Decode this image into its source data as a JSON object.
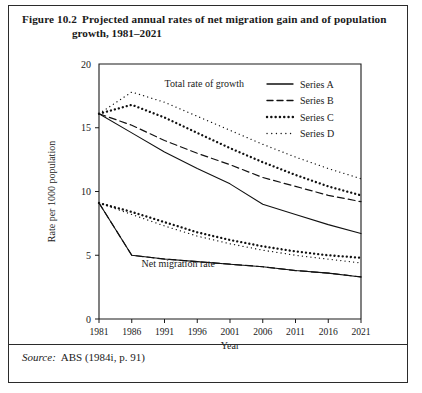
{
  "figure": {
    "number": "Figure 10.2",
    "caption_line1": "Projected annual rates of net migration gain and of population",
    "caption_line2": "growth, 1981–2021",
    "source_label": "Source:",
    "source_text": "ABS (1984i, p. 91)"
  },
  "chart_data": {
    "type": "line",
    "title": "Projected annual rates of net migration gain and of population growth, 1981–2021",
    "xlabel": "Year",
    "ylabel": "Rate per 1000 population",
    "x": [
      1981,
      1986,
      1991,
      1996,
      2001,
      2006,
      2011,
      2016,
      2021
    ],
    "xtick_labels": [
      "1981",
      "1986",
      "1991",
      "1996",
      "2001",
      "2006",
      "2011",
      "2016",
      "2021"
    ],
    "ytick_labels": [
      "0",
      "5",
      "10",
      "15",
      "20"
    ],
    "yticks": [
      0,
      5,
      10,
      15,
      20
    ],
    "xlim": [
      1981,
      2021
    ],
    "ylim": [
      0,
      20
    ],
    "grid": false,
    "legend_position": "top-right",
    "annotations": [
      {
        "text": "Total rate of growth",
        "x": 1991,
        "y": 18.2
      },
      {
        "text": "Net migration rate",
        "x": 1987.5,
        "y": 4.1
      }
    ],
    "groups": [
      {
        "name": "Total rate of growth",
        "series": [
          {
            "name": "Series A",
            "style": "solid",
            "values": [
              16.1,
              14.6,
              13.1,
              11.8,
              10.6,
              9.0,
              8.2,
              7.4,
              6.7
            ]
          },
          {
            "name": "Series B",
            "style": "dashed",
            "values": [
              16.1,
              15.2,
              14.0,
              13.0,
              12.1,
              11.1,
              10.4,
              9.7,
              9.2
            ]
          },
          {
            "name": "Series C",
            "style": "dotted-bold",
            "values": [
              16.1,
              16.8,
              15.8,
              14.6,
              13.4,
              12.3,
              11.3,
              10.4,
              9.7
            ]
          },
          {
            "name": "Series D",
            "style": "dotted-fine",
            "values": [
              16.1,
              17.8,
              17.0,
              15.9,
              14.8,
              13.7,
              12.7,
              11.8,
              11.0
            ]
          }
        ]
      },
      {
        "name": "Net migration rate",
        "series": [
          {
            "name": "Series A",
            "style": "solid",
            "values": [
              9.1,
              5.0,
              4.7,
              4.5,
              4.3,
              4.1,
              3.8,
              3.6,
              3.3
            ]
          },
          {
            "name": "Series B",
            "style": "dashed",
            "values": [
              9.1,
              5.0,
              4.7,
              4.5,
              4.3,
              4.1,
              3.8,
              3.6,
              3.3
            ]
          },
          {
            "name": "Series C",
            "style": "dotted-bold",
            "values": [
              9.1,
              8.4,
              7.6,
              6.8,
              6.2,
              5.7,
              5.3,
              5.0,
              4.8
            ]
          },
          {
            "name": "Series D",
            "style": "dotted-fine",
            "values": [
              9.1,
              8.2,
              7.3,
              6.5,
              5.9,
              5.4,
              5.0,
              4.7,
              4.4
            ]
          }
        ]
      }
    ],
    "legend": [
      {
        "label": "Series A",
        "style": "solid"
      },
      {
        "label": "Series B",
        "style": "dashed"
      },
      {
        "label": "Series C",
        "style": "dotted-bold"
      },
      {
        "label": "Series D",
        "style": "dotted-fine"
      }
    ]
  }
}
